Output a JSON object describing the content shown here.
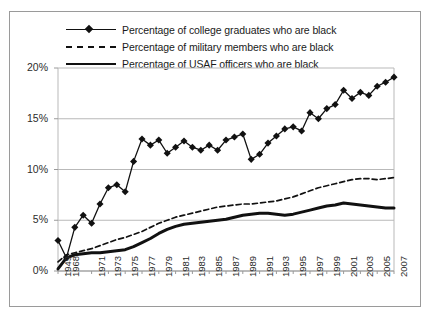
{
  "legend": {
    "items": [
      {
        "label": "Percentage of college graduates who are black",
        "key": "solid-marker"
      },
      {
        "label": "Percentage of military members who are black",
        "key": "dashed"
      },
      {
        "label": "Percentage of USAF officers who are black",
        "key": "solid-thick"
      }
    ]
  },
  "chart_data": {
    "type": "line",
    "title": "",
    "xlabel": "",
    "ylabel": "",
    "ylim": [
      0,
      20
    ],
    "yticks": [
      0,
      5,
      10,
      15,
      20
    ],
    "ytick_labels": [
      "0%",
      "5%",
      "10%",
      "15%",
      "20%"
    ],
    "grid": true,
    "legend_position": "top",
    "x": [
      1949,
      1968,
      1969,
      1970,
      1971,
      1972,
      1973,
      1974,
      1975,
      1976,
      1977,
      1978,
      1979,
      1980,
      1981,
      1982,
      1983,
      1984,
      1985,
      1986,
      1987,
      1988,
      1989,
      1990,
      1991,
      1992,
      1993,
      1994,
      1995,
      1996,
      1997,
      1998,
      1999,
      2000,
      2001,
      2002,
      2003,
      2004,
      2005,
      2006,
      2007
    ],
    "xtick_labels": [
      "1949",
      "1968",
      "1971",
      "1973",
      "1975",
      "1977",
      "1979",
      "1981",
      "1983",
      "1985",
      "1987",
      "1989",
      "1991",
      "1993",
      "1995",
      "1997",
      "1999",
      "2001",
      "2003",
      "2005",
      "2007"
    ],
    "xtick_years": [
      1949,
      1968,
      1971,
      1973,
      1975,
      1977,
      1979,
      1981,
      1983,
      1985,
      1987,
      1989,
      1991,
      1993,
      1995,
      1997,
      1999,
      2001,
      2003,
      2005,
      2007
    ],
    "series": [
      {
        "name": "Percentage of college graduates who are black",
        "style": "solid-marker",
        "values": [
          3.0,
          1.3,
          4.3,
          5.5,
          4.7,
          6.6,
          8.2,
          8.5,
          7.8,
          10.8,
          13.0,
          12.4,
          12.9,
          11.6,
          12.2,
          12.8,
          12.2,
          11.9,
          12.4,
          11.9,
          12.9,
          13.2,
          13.5,
          11.0,
          11.5,
          12.6,
          13.3,
          14.0,
          14.2,
          13.8,
          15.6,
          15.0,
          16.0,
          16.4,
          17.8,
          17.0,
          17.6,
          17.3,
          18.2,
          18.6,
          19.1
        ]
      },
      {
        "name": "Percentage of military members who are black",
        "style": "dashed",
        "values": [
          0.9,
          1.6,
          1.8,
          2.0,
          2.2,
          2.5,
          2.8,
          3.1,
          3.3,
          3.6,
          3.9,
          4.3,
          4.7,
          5.0,
          5.3,
          5.5,
          5.7,
          5.9,
          6.1,
          6.3,
          6.4,
          6.5,
          6.6,
          6.6,
          6.7,
          6.8,
          6.9,
          7.1,
          7.3,
          7.6,
          7.9,
          8.2,
          8.4,
          8.6,
          8.8,
          9.0,
          9.1,
          9.1,
          9.0,
          9.1,
          9.2
        ]
      },
      {
        "name": "Percentage of USAF officers who are black",
        "style": "solid-thick",
        "values": [
          0.2,
          1.3,
          1.6,
          1.7,
          1.8,
          1.8,
          1.9,
          2.0,
          2.1,
          2.4,
          2.8,
          3.2,
          3.7,
          4.1,
          4.4,
          4.6,
          4.7,
          4.8,
          4.9,
          5.0,
          5.1,
          5.3,
          5.5,
          5.6,
          5.7,
          5.7,
          5.6,
          5.5,
          5.6,
          5.8,
          6.0,
          6.2,
          6.4,
          6.5,
          6.7,
          6.6,
          6.5,
          6.4,
          6.3,
          6.2,
          6.2
        ]
      }
    ]
  }
}
